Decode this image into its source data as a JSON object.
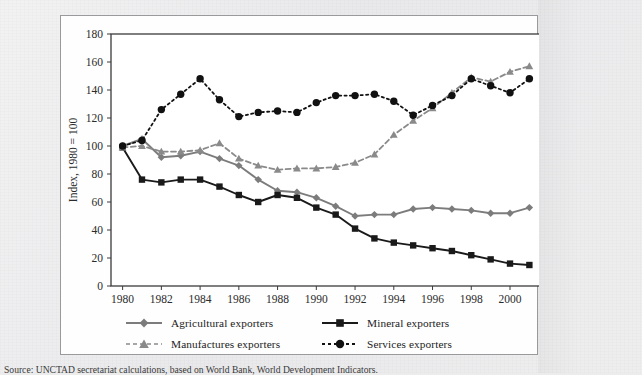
{
  "figure": {
    "y_axis_label": "Index, 1980 = 100",
    "source_note": "Source:  UNCTAD secretariat calculations, based on World Bank, World Development Indicators."
  },
  "legend": {
    "items": [
      {
        "label": "Agricultural exporters",
        "marker": "diamond-marker",
        "line": "solid",
        "color": "#7c7c7c"
      },
      {
        "label": "Mineral exporters",
        "marker": "square-marker",
        "line": "solid",
        "color": "#1a1a1a"
      },
      {
        "label": "Manufactures exporters",
        "marker": "triangle-marker",
        "line": "dashed",
        "color": "#8a8a8a"
      },
      {
        "label": "Services exporters",
        "marker": "circle-marker",
        "line": "dotted",
        "color": "#111111"
      }
    ]
  },
  "chart_data": {
    "type": "line",
    "title": "",
    "xlabel": "",
    "ylabel": "Index, 1980 = 100",
    "xlim": [
      1979.4,
      2001.6
    ],
    "ylim": [
      0,
      180
    ],
    "yticks": [
      0,
      20,
      40,
      60,
      80,
      100,
      120,
      140,
      160,
      180
    ],
    "xticks": [
      1980,
      1982,
      1984,
      1986,
      1988,
      1990,
      1992,
      1994,
      1996,
      1998,
      2000
    ],
    "xtick_labels": [
      "1980",
      "1982",
      "1984",
      "1986",
      "1988",
      "1990",
      "1992",
      "1994",
      "1996",
      "1998",
      "2000"
    ],
    "grid": false,
    "legend_position": "below",
    "x": [
      1980,
      1981,
      1982,
      1983,
      1984,
      1985,
      1986,
      1987,
      1988,
      1989,
      1990,
      1991,
      1992,
      1993,
      1994,
      1995,
      1996,
      1997,
      1998,
      1999,
      2000,
      2001
    ],
    "series": [
      {
        "name": "Agricultural exporters",
        "marker": "diamond",
        "linestyle": "solid",
        "color": "#7c7c7c",
        "values": [
          100,
          105,
          92,
          93,
          96,
          91,
          86,
          76,
          68,
          67,
          63,
          57,
          50,
          51,
          51,
          55,
          56,
          55,
          54,
          52,
          52,
          56
        ]
      },
      {
        "name": "Mineral exporters",
        "marker": "square",
        "linestyle": "solid",
        "color": "#1a1a1a",
        "values": [
          99,
          76,
          74,
          76,
          76,
          71,
          65,
          60,
          65,
          63,
          56,
          51,
          41,
          34,
          31,
          29,
          27,
          25,
          22,
          19,
          16,
          15
        ]
      },
      {
        "name": "Manufactures exporters",
        "marker": "triangle",
        "linestyle": "dashed",
        "color": "#8a8a8a",
        "values": [
          99,
          100,
          96,
          96,
          97,
          102,
          91,
          86,
          83,
          84,
          84,
          85,
          88,
          94,
          108,
          118,
          127,
          138,
          149,
          146,
          153,
          157
        ]
      },
      {
        "name": "Services exporters",
        "marker": "circle",
        "linestyle": "dotted",
        "color": "#111111",
        "values": [
          100,
          104,
          126,
          137,
          148,
          133,
          121,
          124,
          125,
          124,
          131,
          136,
          136,
          137,
          132,
          122,
          129,
          136,
          148,
          143,
          138,
          148
        ]
      }
    ]
  }
}
